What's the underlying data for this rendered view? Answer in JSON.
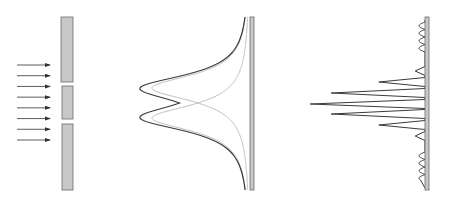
{
  "diagram": {
    "panels": [
      {
        "name": "incident-wave-and-double-slit",
        "description": "Parallel plane-wave arrows incident on a barrier with two slits"
      },
      {
        "name": "single-slit-diffraction-envelopes",
        "description": "Two overlapping single-slit intensity profiles (light) and their sum (dark) on a screen"
      },
      {
        "name": "interference-pattern",
        "description": "Interference fringe intensity pattern on a screen with side lobes"
      }
    ],
    "incident_arrow_count": 8,
    "slit_count": 2,
    "interference_fringes": {
      "relative_peak_heights": [
        0.07,
        0.33,
        0.67,
        0.82,
        0.67,
        0.33,
        0.07
      ]
    },
    "colors": {
      "barrier_fill": "#c8c8c8",
      "barrier_stroke": "#6a6a6a",
      "curve_dark": "#3a3a3a",
      "curve_light": "#b8b8b8",
      "arrow": "#333333"
    }
  }
}
